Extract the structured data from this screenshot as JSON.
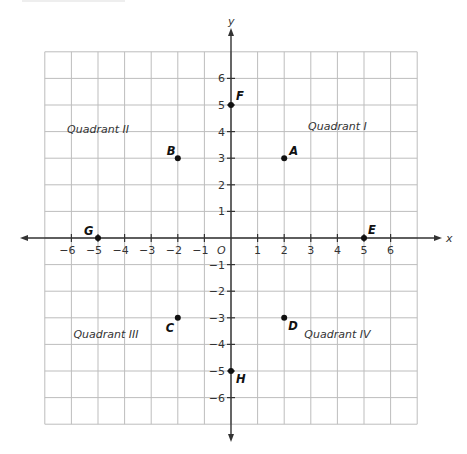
{
  "chart_data": {
    "type": "scatter",
    "title": "",
    "xlabel": "x",
    "ylabel": "y",
    "origin_label": "O",
    "xlim": [
      -7,
      7
    ],
    "ylim": [
      -7,
      7
    ],
    "grid": true,
    "grid_range": {
      "x": [
        -7,
        7
      ],
      "y": [
        -7,
        7
      ]
    },
    "x_ticks": [
      -6,
      -5,
      -4,
      -3,
      -2,
      -1,
      1,
      2,
      3,
      4,
      5,
      6
    ],
    "y_ticks": [
      -6,
      -5,
      -4,
      -3,
      -2,
      -1,
      1,
      2,
      3,
      4,
      5,
      6
    ],
    "points": [
      {
        "label": "A",
        "x": 2,
        "y": 3
      },
      {
        "label": "B",
        "x": -2,
        "y": 3
      },
      {
        "label": "C",
        "x": -2,
        "y": -3
      },
      {
        "label": "D",
        "x": 2,
        "y": -3
      },
      {
        "label": "E",
        "x": 5,
        "y": 0
      },
      {
        "label": "F",
        "x": 0,
        "y": 5
      },
      {
        "label": "G",
        "x": -5,
        "y": 0
      },
      {
        "label": "H",
        "x": 0,
        "y": -5
      }
    ],
    "annotations": [
      {
        "text": "Quadrant I",
        "x": 4.0,
        "y": 4.2
      },
      {
        "text": "Quadrant II",
        "x": -5.0,
        "y": 4.1
      },
      {
        "text": "Quadrant III",
        "x": -4.7,
        "y": -3.6
      },
      {
        "text": "Quadrant IV",
        "x": 4.0,
        "y": -3.6
      }
    ]
  },
  "colors": {
    "grid": "#bdbdbd",
    "axis": "#333333",
    "point": "#111111",
    "text": "#333333"
  }
}
